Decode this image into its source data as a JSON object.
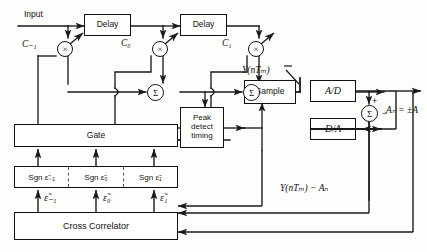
{
  "diagram": {
    "input_label": "Input",
    "output_label": "Aₙ = ±A",
    "blocks": {
      "delay1": "Delay",
      "delay2": "Delay",
      "gate": "Gate",
      "peak_detect": [
        "Peak",
        "detect",
        "timing"
      ],
      "sample": "Sample",
      "adc": "A/D",
      "dac": "D/A",
      "cross_correlator": "Cross Correlator"
    },
    "coefficients": [
      "C₋₁",
      "C₀",
      "C₁"
    ],
    "multiplier_symbol": "×",
    "summer_symbol": "Σ",
    "sgn_cells": [
      "Sgn ε̃₋₁",
      "Sgn ε̃₀",
      "Sgn ε̃₁"
    ],
    "epsilon_labels": [
      "ε̃₋₁",
      "ε̃₀",
      "ε̃₁"
    ],
    "signal_labels": {
      "sampled": "Y(nTₘ)",
      "error": "Y(nTₘ) − Aₙ"
    },
    "sign_marks": {
      "plus": "+",
      "minus": "−"
    },
    "colors": {
      "line": "#1a1a1a",
      "background": "#fdfdfc",
      "box_fill": "#ffffff"
    }
  }
}
